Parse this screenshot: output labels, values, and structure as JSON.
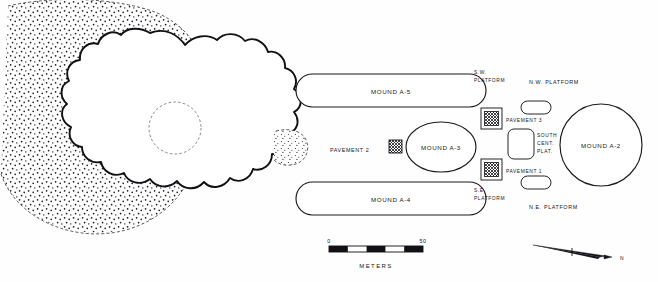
{
  "figure": {
    "type": "archaeological-site-plan"
  },
  "features": {
    "main_mound": {
      "name": "central-scalloped-mound",
      "has_stipple_field": true,
      "has_radiating_rays": true,
      "has_central_depression": true
    },
    "mound_a5": {
      "label": "MOUND A-5",
      "shape": "rounded-rectangle"
    },
    "mound_a4": {
      "label": "MOUND A-4",
      "shape": "rounded-rectangle"
    },
    "mound_a3": {
      "label": "MOUND A-3",
      "shape": "ellipse"
    },
    "mound_a2": {
      "label": "MOUND A-2",
      "shape": "circle"
    },
    "pavement_1": {
      "label": "PAVEMENT 1",
      "shape": "hatched-square"
    },
    "pavement_2": {
      "label": "PAVEMENT 2",
      "shape": "hatched-square"
    },
    "pavement_3": {
      "label": "PAVEMENT 3",
      "shape": "hatched-square"
    },
    "sw_platform": {
      "label_line1": "S.W.",
      "label_line2": "PLATFORM"
    },
    "se_platform": {
      "label_line1": "S.E.",
      "label_line2": "PLATFORM"
    },
    "nw_platform": {
      "label": "N.W. PLATFORM"
    },
    "ne_platform": {
      "label": "N.E. PLATFORM"
    },
    "south_central_platform": {
      "label_line1": "SOUTH",
      "label_line2": "CENT.",
      "label_line3": "PLAT.",
      "shape": "rounded-rectangle-vertical"
    }
  },
  "scale_bar": {
    "start_label": "0",
    "end_label": "50",
    "units_label": "METERS",
    "segments": 5
  },
  "north_arrow": {
    "label": "N",
    "direction": "right"
  },
  "colors": {
    "ink": "#111115",
    "stipple": "#1a1a20",
    "ray": "#6a6a72",
    "paper": "#fefefe"
  }
}
